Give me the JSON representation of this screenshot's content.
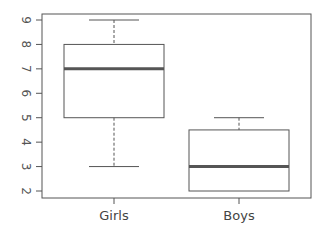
{
  "chart_data": {
    "type": "boxplot",
    "title": "",
    "xlabel": "",
    "ylabel": "",
    "categories": [
      "Girls",
      "Boys"
    ],
    "series": [
      {
        "name": "Girls",
        "min": 3,
        "q1": 5,
        "median": 7,
        "q3": 8,
        "max": 9
      },
      {
        "name": "Boys",
        "min": 2,
        "q1": 2,
        "median": 3,
        "q3": 4.5,
        "max": 5
      }
    ],
    "yticks": [
      2,
      3,
      4,
      5,
      6,
      7,
      8,
      9
    ],
    "ylim": [
      1.7,
      9.25
    ],
    "grid": false,
    "legend": "none",
    "ytick_label_rotation": 90
  },
  "colors": {
    "frame": "#555555",
    "box": "#555555",
    "median": "#555555",
    "whisker": "#555555",
    "text": "#555555"
  }
}
